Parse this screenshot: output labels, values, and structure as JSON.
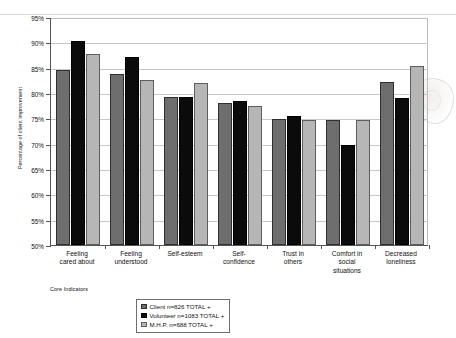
{
  "chart_data": {
    "type": "bar",
    "title": "",
    "xlabel": "Core Indicators",
    "ylabel": "Percentage of client improvement",
    "ylim": [
      50,
      95
    ],
    "ytick_labels": [
      "95%",
      "90%",
      "85%",
      "80%",
      "75%",
      "70%",
      "65%",
      "60%",
      "55%",
      "50%"
    ],
    "ytick_values": [
      95,
      90,
      85,
      80,
      75,
      70,
      65,
      60,
      55,
      50
    ],
    "grid": true,
    "legend_position": "bottom-center",
    "categories": [
      "Feeling cared about",
      "Feeling understood",
      "Self-esteem",
      "Self-confidence",
      "Trust in others",
      "Comfort in social situations",
      "Decreased loneliness"
    ],
    "category_lines": [
      [
        "Feeling",
        "cared about"
      ],
      [
        "Feeling",
        "understood"
      ],
      [
        "Self-esteem"
      ],
      [
        "Self-",
        "confidence"
      ],
      [
        "Trust in",
        "others"
      ],
      [
        "Comfort in",
        "social",
        "situations"
      ],
      [
        "Decreased",
        "loneliness"
      ]
    ],
    "series": [
      {
        "name": "Client n=826 TOTAL +",
        "color": "#6e6e6e",
        "values": [
          84.5,
          83.7,
          79.3,
          78.1,
          74.8,
          74.7,
          82.1
        ]
      },
      {
        "name": "Volunteer n=1083 TOTAL +",
        "color": "#0b0b0b",
        "values": [
          90.2,
          87.1,
          79.3,
          78.5,
          75.5,
          69.8,
          79.0
        ]
      },
      {
        "name": "M.H.P. n=688 TOTAL +",
        "color": "#b6b6b6",
        "values": [
          87.7,
          82.5,
          81.9,
          77.4,
          74.7,
          74.7,
          85.4
        ]
      }
    ]
  },
  "legend": {
    "items": [
      {
        "label": "Client n=826 TOTAL +"
      },
      {
        "label": "Volunteer n=1083 TOTAL +"
      },
      {
        "label": "M.H.P. n=688 TOTAL +"
      }
    ]
  },
  "axis": {
    "x_title": "Core Indicators",
    "y_title": "Percentage of client improvement"
  }
}
